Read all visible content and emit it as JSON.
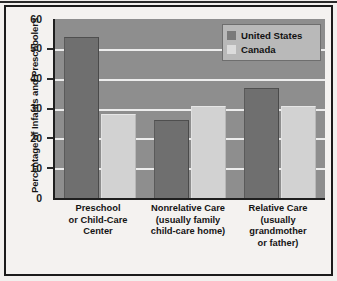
{
  "chart_data": {
    "type": "bar",
    "title": "",
    "subtitle": "",
    "xlabel": "",
    "ylabel": "Percentage of Infants and Preschoolers",
    "ylim": [
      0,
      60
    ],
    "yticks": [
      0,
      10,
      20,
      30,
      40,
      50,
      60
    ],
    "ytick_labels": [
      "0",
      "10",
      "20",
      "30",
      "40",
      "50",
      "60"
    ],
    "grid": "horizontal",
    "legend_position": "top-right",
    "categories": [
      "Preschool or Child-Care Center",
      "Nonrelative Care (usually family child-care home)",
      "Relative Care (usually grandmother or father)"
    ],
    "category_lines": [
      [
        "Preschool",
        "or Child-Care",
        "Center"
      ],
      [
        "Nonrelative Care",
        "(usually family",
        "child-care home)"
      ],
      [
        "Relative Care",
        "(usually",
        "grandmother",
        "or father)"
      ]
    ],
    "series": [
      {
        "name": "United States",
        "color": "#6f6f6f",
        "values": [
          54,
          26,
          37
        ]
      },
      {
        "name": "Canada",
        "color": "#d2d2d2",
        "values": [
          28,
          31,
          31
        ]
      }
    ]
  },
  "legend": {
    "items": [
      {
        "label": "United States",
        "swatch": "us"
      },
      {
        "label": "Canada",
        "swatch": "ca"
      }
    ]
  },
  "axis": {
    "y_title": "Percentage of Infants and Preschoolers",
    "y_ticks": [
      "60",
      "50",
      "40",
      "30",
      "20",
      "10",
      "0"
    ]
  }
}
